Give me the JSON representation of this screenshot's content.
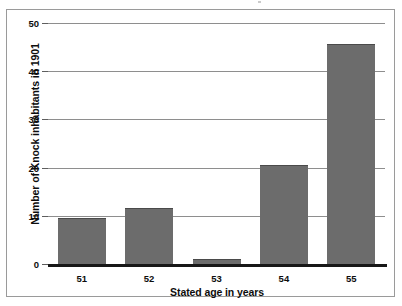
{
  "chart_data": {
    "type": "bar",
    "title": "",
    "xlabel": "Stated age in years",
    "ylabel": "Number of Knock inhabitants in 1901",
    "categories": [
      "51",
      "52",
      "53",
      "54",
      "55"
    ],
    "values": [
      10,
      12,
      1.5,
      21,
      46
    ],
    "series": [
      {
        "name": "Number of Knock inhabitants in 1901",
        "values": [
          10,
          12,
          1.5,
          21,
          46
        ]
      }
    ],
    "ylim": [
      0,
      50
    ],
    "yticks": [
      0,
      10,
      20,
      30,
      40,
      50
    ],
    "ytick_labels": [
      "0",
      "10",
      "20",
      "30",
      "40",
      "50"
    ],
    "grid": true,
    "grid_axis": "y",
    "legend": false,
    "legend_position": "none",
    "bar_color": "#6c6c6c",
    "grid_color": "#8e8e8e",
    "axis_color": "#171717",
    "background": "#ffffff"
  },
  "axes": {
    "y_title": "Number of Knock inhabitants in 1901",
    "x_title": "Stated age in years"
  }
}
